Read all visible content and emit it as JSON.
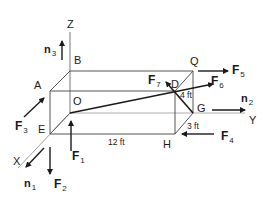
{
  "diagram": {
    "type": "3D rectangular box force diagram",
    "axes": {
      "x": "X",
      "y": "Y",
      "z": "Z"
    },
    "points": {
      "A": "A",
      "B": "B",
      "D": "D",
      "E": "E",
      "G": "G",
      "H": "H",
      "O": "O",
      "Q": "Q"
    },
    "dimensions": {
      "length": "12 ft",
      "height": "4 ft",
      "depth": "3 ft"
    },
    "unit_vectors": [
      {
        "name": "n",
        "sub": "1",
        "axis": "X"
      },
      {
        "name": "n",
        "sub": "2",
        "axis": "Y"
      },
      {
        "name": "n",
        "sub": "3",
        "axis": "Z"
      }
    ],
    "forces": [
      {
        "name": "F",
        "sub": "1",
        "at": "E",
        "direction": "up (+Z)"
      },
      {
        "name": "F",
        "sub": "2",
        "at": "E",
        "direction": "down (-Z)"
      },
      {
        "name": "F",
        "sub": "3",
        "at": "E",
        "direction": "toward A side, diagonal"
      },
      {
        "name": "F",
        "sub": "4",
        "at": "H",
        "direction": "-Y"
      },
      {
        "name": "F",
        "sub": "5",
        "at": "Q",
        "direction": "+Y"
      },
      {
        "name": "F",
        "sub": "6",
        "at": "D",
        "direction": "along O to D"
      },
      {
        "name": "F",
        "sub": "7",
        "at": "D",
        "direction": "along G to D"
      }
    ],
    "colors": {
      "line": "#1a1a1a",
      "axis": "#888888",
      "background": "#ffffff"
    }
  }
}
